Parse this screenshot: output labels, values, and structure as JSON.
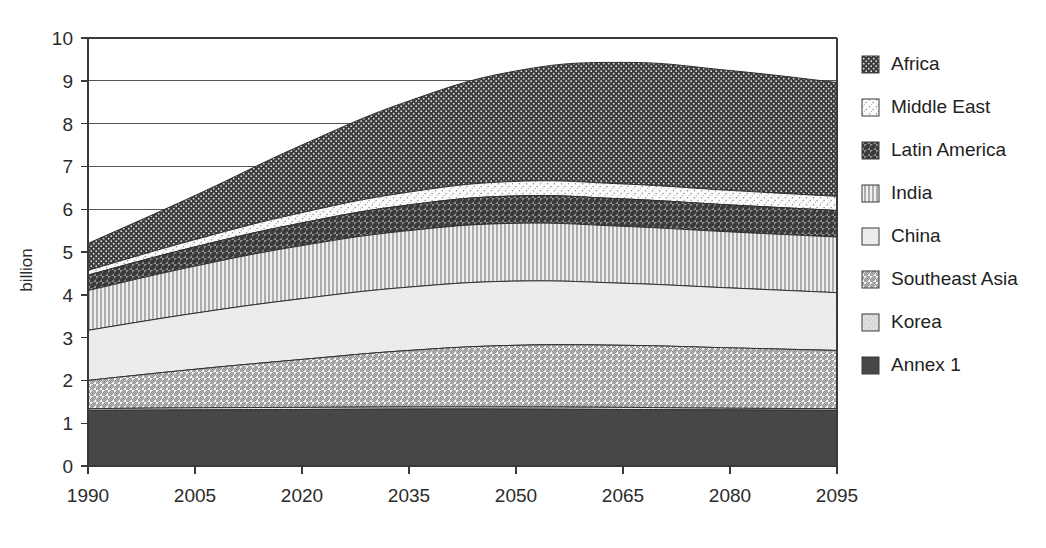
{
  "chart_data": {
    "type": "area",
    "title": "",
    "subtitle": "",
    "xlabel": "",
    "ylabel": "billion",
    "stacked": true,
    "grid": true,
    "legend_position": "right",
    "xlim": [
      1990,
      2095
    ],
    "ylim": [
      0,
      10
    ],
    "y_ticks": [
      0,
      1,
      2,
      3,
      4,
      5,
      6,
      7,
      8,
      9,
      10
    ],
    "x_ticks": [
      1990,
      2005,
      2020,
      2035,
      2050,
      2065,
      2080,
      2095
    ],
    "x_tick_labels": [
      "1990",
      "2005",
      "2020",
      "2035",
      "2050",
      "2065",
      "2080",
      "2095"
    ],
    "y_tick_labels": [
      "0",
      "1",
      "2",
      "3",
      "4",
      "5",
      "6",
      "7",
      "8",
      "9",
      "10"
    ],
    "x": [
      1990,
      2005,
      2020,
      2035,
      2050,
      2065,
      2080,
      2095
    ],
    "series": [
      {
        "name": "Annex 1",
        "pattern": "solid-dark",
        "color": "#474747",
        "values": [
          1.3,
          1.31,
          1.32,
          1.33,
          1.33,
          1.32,
          1.31,
          1.3
        ]
      },
      {
        "name": "Korea",
        "pattern": "light-speckle",
        "color": "#d9d9d9",
        "values": [
          0.04,
          0.05,
          0.05,
          0.05,
          0.05,
          0.05,
          0.04,
          0.04
        ]
      },
      {
        "name": "Southeast Asia",
        "pattern": "light-diagonal-hatch",
        "color": "#e8e8e8",
        "values": [
          0.66,
          0.9,
          1.12,
          1.32,
          1.44,
          1.45,
          1.41,
          1.36
        ]
      },
      {
        "name": "China",
        "pattern": "plain-light",
        "color": "#ededed",
        "values": [
          1.17,
          1.31,
          1.42,
          1.48,
          1.5,
          1.45,
          1.4,
          1.35
        ]
      },
      {
        "name": "India",
        "pattern": "vertical-lines",
        "color": "#dcdcdc",
        "values": [
          0.93,
          1.1,
          1.24,
          1.32,
          1.35,
          1.33,
          1.31,
          1.3
        ]
      },
      {
        "name": "Latin America",
        "pattern": "dark-diagonal-hatch",
        "color": "#8a8a8a",
        "values": [
          0.36,
          0.45,
          0.53,
          0.6,
          0.64,
          0.64,
          0.63,
          0.62
        ]
      },
      {
        "name": "Middle East",
        "pattern": "sparse-speckle",
        "color": "#f2f2f2",
        "values": [
          0.11,
          0.17,
          0.24,
          0.3,
          0.34,
          0.35,
          0.34,
          0.33
        ]
      },
      {
        "name": "Africa",
        "pattern": "dark-dotted",
        "color": "#3d3d3d",
        "values": [
          0.63,
          1.03,
          1.58,
          2.13,
          2.58,
          2.84,
          2.8,
          2.66
        ]
      }
    ],
    "stack_tops": {
      "1990": [
        1.3,
        1.34,
        2.0,
        3.17,
        4.1,
        4.46,
        4.57,
        5.2
      ],
      "2005": [
        1.31,
        1.36,
        2.26,
        3.57,
        4.67,
        5.12,
        5.29,
        6.32
      ],
      "2020": [
        1.32,
        1.37,
        2.49,
        3.91,
        5.15,
        5.68,
        5.92,
        7.5
      ],
      "2035": [
        1.33,
        1.38,
        2.7,
        4.18,
        5.5,
        6.1,
        6.4,
        8.53
      ],
      "2050": [
        1.33,
        1.38,
        2.82,
        4.32,
        5.67,
        6.31,
        6.65,
        9.23
      ],
      "2065": [
        1.32,
        1.37,
        2.82,
        4.27,
        5.6,
        6.24,
        6.59,
        9.43
      ],
      "2080": [
        1.31,
        1.35,
        2.76,
        4.16,
        5.47,
        6.1,
        6.44,
        9.24
      ],
      "2095": [
        1.3,
        1.34,
        2.7,
        4.05,
        5.35,
        5.97,
        6.3,
        8.96
      ]
    },
    "totals": [
      5.2,
      6.32,
      7.5,
      8.53,
      9.23,
      9.43,
      9.24,
      8.96
    ],
    "annotations": []
  },
  "legend": {
    "items": [
      {
        "label": "Africa",
        "swatch": "dark-dotted"
      },
      {
        "label": "Middle East",
        "swatch": "sparse-speckle"
      },
      {
        "label": "Latin America",
        "swatch": "dark-diagonal-hatch"
      },
      {
        "label": "India",
        "swatch": "vertical-lines"
      },
      {
        "label": "China",
        "swatch": "plain-light"
      },
      {
        "label": "Southeast Asia",
        "swatch": "light-diagonal-hatch"
      },
      {
        "label": "Korea",
        "swatch": "light-speckle"
      },
      {
        "label": "Annex 1",
        "swatch": "solid-dark"
      }
    ]
  },
  "axes": {
    "y_title": "billion"
  },
  "colors": {
    "background": "#ffffff",
    "axis": "#3a3a3a",
    "grid": "#555555",
    "text": "#222222"
  }
}
